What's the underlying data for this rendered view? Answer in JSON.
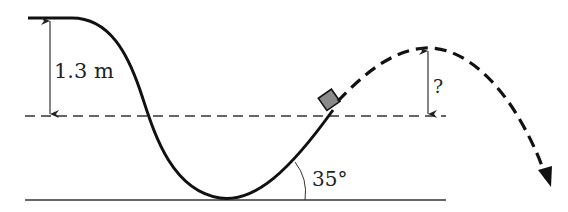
{
  "diagram": {
    "type": "physics-track-projectile",
    "labels": {
      "drop_height": "1.3 m",
      "unknown_height": "?",
      "launch_angle": "35°"
    },
    "elements": {
      "track": "solid curved track descending from a flat start, through a valley, rising to launch point",
      "reference_line": "dashed horizontal line at launch height",
      "ground": "solid horizontal ground line",
      "block": "gray square block at launch point",
      "trajectory": "dashed parabolic projectile path ending in arrow"
    },
    "colors": {
      "stroke": "#111111",
      "block_fill": "#8a8a8a",
      "thin_line": "#333333"
    }
  }
}
